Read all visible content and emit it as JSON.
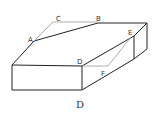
{
  "figure": {
    "caption": "D",
    "labels": {
      "A": "A",
      "B": "B",
      "C": "C",
      "D": "D",
      "E": "E",
      "F": "F"
    },
    "colors": {
      "edge": "#222222",
      "aux": "#999999",
      "background": "#ffffff"
    }
  }
}
